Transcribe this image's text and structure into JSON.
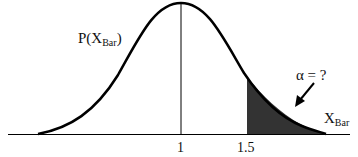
{
  "diagram": {
    "type": "normal-distribution-tail-area",
    "curve_label": {
      "main": "P(X",
      "sub": "Bar",
      "close": ")"
    },
    "axis_label": {
      "main": "X",
      "sub": "Bar"
    },
    "ticks": [
      {
        "value": "1",
        "x": 181
      },
      {
        "value": "1.5",
        "x": 247
      }
    ],
    "annotation": "α = ?",
    "shaded_region": {
      "from": "1.5",
      "to": "+∞",
      "color": "#333333"
    },
    "colors": {
      "curve": "#000000",
      "fill": "#333333",
      "axis": "#000000"
    }
  }
}
